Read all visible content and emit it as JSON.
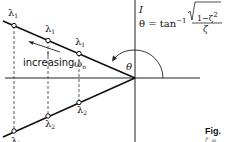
{
  "diagram": {
    "type": "root-locus-s-plane",
    "axis_label_imag": "I",
    "formula": {
      "lhs": "θ = tan",
      "exponent": "−1",
      "numerator": "1−ζ",
      "numerator_exp": "2",
      "denominator": "ζ"
    },
    "angle_label": "θ",
    "increasing_label": "increasing",
    "omega_label": "ω",
    "omega_sub": "n",
    "upper_points": [
      {
        "label": "λ",
        "sub": "1"
      },
      {
        "label": "λ",
        "sub": "1"
      },
      {
        "label": "λ",
        "sub": "1"
      }
    ],
    "lower_points": [
      {
        "label": "λ",
        "sub": "2"
      },
      {
        "label": "λ",
        "sub": "2"
      },
      {
        "label": "λ",
        "sub": "2"
      }
    ],
    "caption": "Fig.",
    "caption_sub": "ζ = …"
  },
  "colors": {
    "line": "#111111",
    "background": "#ffffff"
  }
}
